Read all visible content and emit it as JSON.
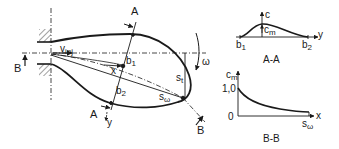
{
  "main_view": {
    "section_a_label_top": "A",
    "section_a_label_bottom": "A",
    "section_b_label_left": "B",
    "section_b_label_right": "B",
    "v_inj": {
      "base": "v",
      "sub": "inj"
    },
    "x_label": "x",
    "y_label": "y",
    "b1": {
      "base": "b",
      "sub": "1"
    },
    "b2": {
      "base": "b",
      "sub": "2"
    },
    "s_t": {
      "base": "s",
      "sub": "t"
    },
    "s_omega": {
      "base": "s",
      "sub": "ω"
    },
    "omega": "ω"
  },
  "section_aa": {
    "title": "A-A",
    "axis_c": "c",
    "axis_y": "y",
    "c_m": {
      "base": "c",
      "sub": "m"
    },
    "b1": {
      "base": "b",
      "sub": "1"
    },
    "b2": {
      "base": "b",
      "sub": "2"
    }
  },
  "section_bb": {
    "title": "B-B",
    "axis_cm": {
      "base": "c",
      "sub": "m"
    },
    "axis_x": "x",
    "tick_1": "1,0",
    "tick_0": "0",
    "s_omega": {
      "base": "s",
      "sub": "ω"
    }
  },
  "colors": {
    "line": "#1a1a1a",
    "background": "#ffffff"
  }
}
